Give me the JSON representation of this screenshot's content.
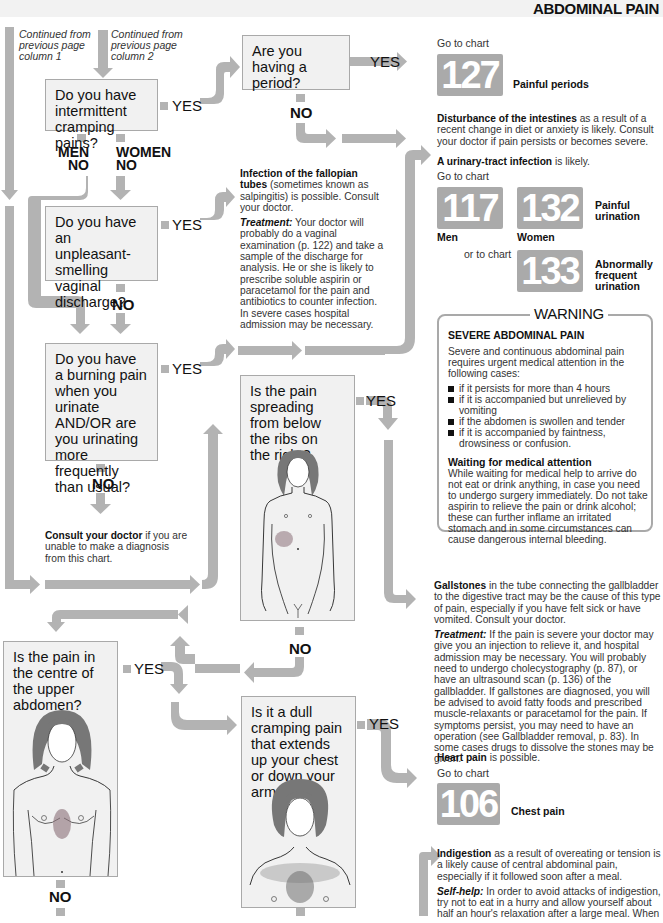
{
  "header": {
    "title": "ABDOMINAL PAIN"
  },
  "continued": [
    {
      "text": "Continued from previous page column 1"
    },
    {
      "text": "Continued from previous page column 2"
    }
  ],
  "labels": {
    "yes": "YES",
    "no": "NO",
    "men_no": "MEN NO",
    "women_no": "WOMEN NO",
    "men": "MEN",
    "women": "WOMEN"
  },
  "questions": {
    "q1": "Do you have intermittent cramping pains?",
    "q2": "Are you having a period?",
    "q3": "Do you have an unpleasant-smelling vaginal discharge?",
    "q4": "Do you have a burning pain when you urinate AND/OR are you urinating more frequently than usual?",
    "q5": "Is the pain spreading from below the ribs on the right?",
    "q6": "Is the pain in the centre of the upper abdomen?",
    "q7": "Is it a dull cramping pain that extends up your chest or down your arms?"
  },
  "outcomes": {
    "periods": {
      "goto": "Go to chart",
      "chart": "127",
      "label": "Painful periods"
    },
    "intestines": {
      "bold": "Disturbance of the intestines",
      "text": " as a result of a recent change in diet or anxiety is likely. Consult your doctor if pain persists or becomes severe."
    },
    "urinary": {
      "bold": "A urinary-tract infection",
      "text": " is likely.",
      "goto": "Go to chart",
      "chart_men": "117",
      "men_label": "Men",
      "chart_women": "132",
      "women_label": "Women",
      "label_132": "Painful urination",
      "or_goto": "or to chart",
      "chart_133": "133",
      "label_133": "Abnormally frequent urination"
    },
    "fallopian": {
      "bold": "Infection of the fallopian tubes",
      "text": " (sometimes known as salpingitis) is possible. Consult your doctor.",
      "treat_label": "Treatment:",
      "treat_text": " Your doctor will probably do a vaginal examination (p. 122) and take a sample of the discharge for analysis. He or she is likely to prescribe soluble aspirin or paracetamol for the pain and antibiotics to counter infection. In severe cases hospital admission may be necessary."
    },
    "consult": {
      "bold": "Consult your doctor",
      "text": " if you are unable to make a diagnosis from this chart."
    },
    "gallstones": {
      "bold": "Gallstones",
      "text": " in the tube connecting the gallbladder to the digestive tract may be the cause of this type of pain, especially if you have felt sick or have vomited. Consult your doctor.",
      "treat_label": "Treatment:",
      "treat_text": " If the pain is severe your doctor may give you an injection to relieve it, and hospital admission may be necessary. You will probably need to undergo cholecystography (p. 87), or have an ultrasound scan (p. 136) of the gallbladder. If gallstones are diagnosed, you will be advised to avoid fatty foods and prescribed muscle-relaxants or paracetamol for the pain. If symptoms persist, you may need to have an operation (see Gallbladder removal, p. 83). In some cases drugs to dissolve the stones may be given."
    },
    "heart": {
      "bold": "Heart pain",
      "text": " is possible.",
      "goto": "Go to chart",
      "chart": "106",
      "label": "Chest pain"
    },
    "indigestion": {
      "bold": "Indigestion",
      "text": " as a result of overeating or tension is a likely cause of central abdominal pain, especially if it followed soon after a meal.",
      "help_label": "Self-help:",
      "help_text": " In order to avoid attacks of indigestion, try not to eat in a hurry and allow yourself about half an hour's relaxation after a large meal. When"
    }
  },
  "warning": {
    "title": "WARNING",
    "heading": "SEVERE ABDOMINAL PAIN",
    "intro": "Severe and continuous abdominal pain requires urgent medical attention in the following cases:",
    "items": [
      "if it persists for more than 4 hours",
      "if it is accompanied but unrelieved by vomiting",
      "if the abdomen is swollen and tender",
      "if it is accompanied by faintness, drowsiness or confusion."
    ],
    "wait_heading": "Waiting for medical attention",
    "wait_text": "While waiting for medical help to arrive do not eat or drink anything, in case you need to undergo surgery immediately. Do not take aspirin to relieve the pain or drink alcohol; these can further inflame an irritated stomach and in some circumstances can cause dangerous internal bleeding."
  },
  "colors": {
    "arrow": "#b3b3b3",
    "box_bg": "#f1f1f1",
    "box_border": "#a9a9a9",
    "chart_bg": "#aaaaaa",
    "pain_shade": "#8a6f78"
  }
}
